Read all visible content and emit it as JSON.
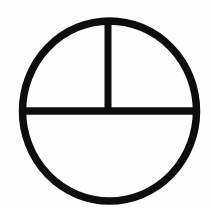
{
  "page": {
    "width": 211,
    "height": 208,
    "background_color": "#fefefe",
    "ink_color": "#0d0d0d"
  },
  "figure": {
    "name": "circle-with-horizontal-diameter-and-upper-vertical-radius",
    "style": "hand-drawn scanned line art, solid black strokes on white",
    "regions_count": 3,
    "region_labels": [
      "upper-left-quadrant",
      "upper-right-quadrant",
      "lower-semicircle"
    ]
  },
  "geometry": {
    "circle": {
      "center_x": 109.5,
      "center_y": 111,
      "radius_x": 87,
      "radius_y": 90,
      "stroke_width": 7.5
    },
    "horizontal_diameter": {
      "x1": 22.5,
      "y1": 111,
      "x2": 196.5,
      "y2": 111,
      "stroke_width": 7.5
    },
    "vertical_radius": {
      "x1": 108,
      "y1": 21,
      "x2": 108,
      "y2": 111,
      "stroke_width": 7
    }
  }
}
